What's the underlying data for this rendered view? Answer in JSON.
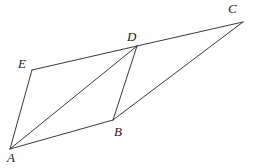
{
  "figure": {
    "type": "geometry-diagram",
    "width": 253,
    "height": 168,
    "background_color": "#fefefe",
    "line_color": "#3a3a3a",
    "label_color": "#1a1a1a",
    "vertices": [
      {
        "name": "A",
        "label": "A",
        "x": 10,
        "y": 149,
        "label_x": 7,
        "label_y": 151
      },
      {
        "name": "B",
        "label": "B",
        "x": 113,
        "y": 120,
        "label_x": 114,
        "label_y": 125
      },
      {
        "name": "C",
        "label": "C",
        "x": 243,
        "y": 22,
        "label_x": 228,
        "label_y": 2
      },
      {
        "name": "D",
        "label": "D",
        "x": 137,
        "y": 46,
        "label_x": 127,
        "label_y": 30
      },
      {
        "name": "E",
        "label": "E",
        "x": 32,
        "y": 70,
        "label_x": 18,
        "label_y": 57
      }
    ],
    "edges": [
      {
        "name": "segment-A-E",
        "from": "A",
        "to": "E"
      },
      {
        "name": "segment-E-D",
        "from": "E",
        "to": "D"
      },
      {
        "name": "segment-A-D",
        "from": "A",
        "to": "D"
      },
      {
        "name": "segment-A-B",
        "from": "A",
        "to": "B"
      },
      {
        "name": "segment-D-B",
        "from": "D",
        "to": "B"
      },
      {
        "name": "segment-B-C",
        "from": "B",
        "to": "C"
      },
      {
        "name": "segment-D-C",
        "from": "D",
        "to": "C"
      }
    ]
  }
}
